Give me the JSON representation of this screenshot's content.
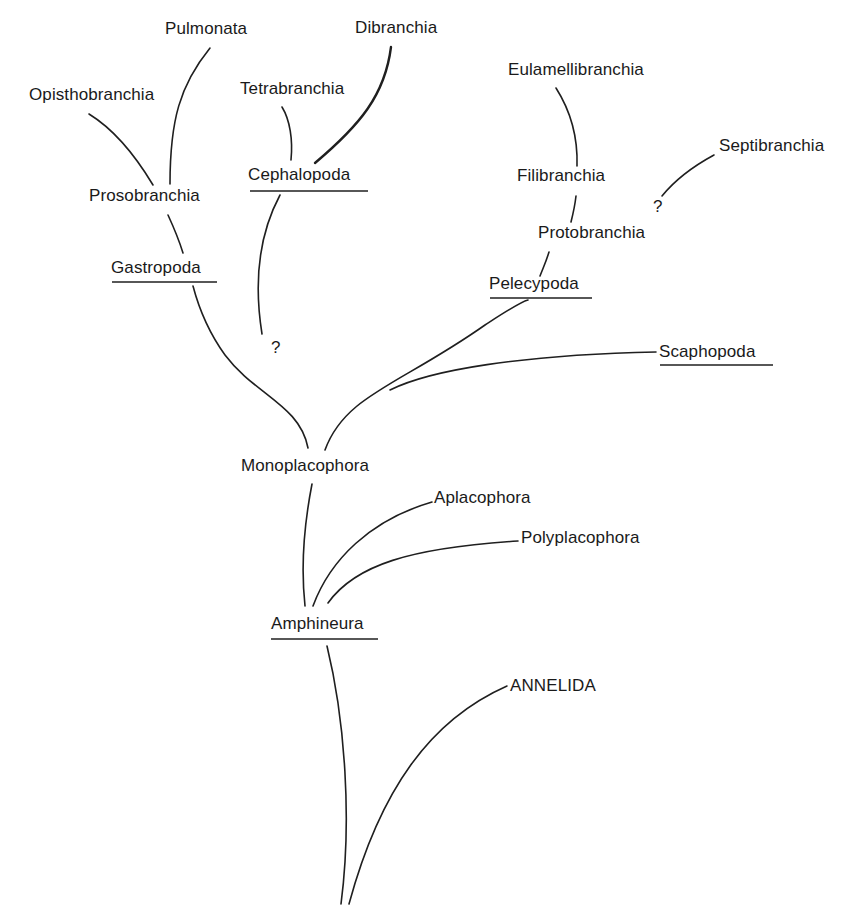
{
  "diagram": {
    "title": "",
    "type": "phylogenetic-tree",
    "nodes": {
      "pulmonata": "Pulmonata",
      "dibranchia": "Dibranchia",
      "opisthobranchia": "Opisthobranchia",
      "tetrabranchia": "Tetrabranchia",
      "prosobranchia": "Prosobranchia",
      "cephalopoda": "Cephalopoda",
      "gastropoda": "Gastropoda",
      "eulamellibranchia": "Eulamellibranchia",
      "septibranchia": "Septibranchia",
      "filibranchia": "Filibranchia",
      "protobranchia": "Protobranchia",
      "pelecypoda": "Pelecypoda",
      "scaphopoda": "Scaphopoda",
      "monoplacophora": "Monoplacophora",
      "aplacophora": "Aplacophora",
      "polyplacophora": "Polyplacophora",
      "amphineura": "Amphineura",
      "annelida": "ANNELIDA"
    },
    "uncertain_marks": {
      "cephalopoda_origin": "?",
      "septibranchia_origin": "?"
    },
    "underlined_classes": [
      "Cephalopoda",
      "Gastropoda",
      "Pelecypoda",
      "Scaphopoda",
      "Amphineura"
    ],
    "edges": [
      [
        "ANNELIDA",
        "root"
      ],
      [
        "Amphineura",
        "root"
      ],
      [
        "Aplacophora",
        "Amphineura"
      ],
      [
        "Polyplacophora",
        "Amphineura"
      ],
      [
        "Monoplacophora",
        "Amphineura"
      ],
      [
        "Gastropoda",
        "Monoplacophora"
      ],
      [
        "Pelecypoda",
        "Monoplacophora"
      ],
      [
        "Scaphopoda",
        "Monoplacophora"
      ],
      [
        "Cephalopoda",
        "?"
      ],
      [
        "Prosobranchia",
        "Gastropoda"
      ],
      [
        "Opisthobranchia",
        "Prosobranchia"
      ],
      [
        "Pulmonata",
        "Prosobranchia"
      ],
      [
        "Tetrabranchia",
        "Cephalopoda"
      ],
      [
        "Dibranchia",
        "Cephalopoda"
      ],
      [
        "Protobranchia",
        "Pelecypoda"
      ],
      [
        "Filibranchia",
        "Protobranchia"
      ],
      [
        "Eulamellibranchia",
        "Filibranchia"
      ],
      [
        "Septibranchia",
        "?"
      ]
    ]
  }
}
